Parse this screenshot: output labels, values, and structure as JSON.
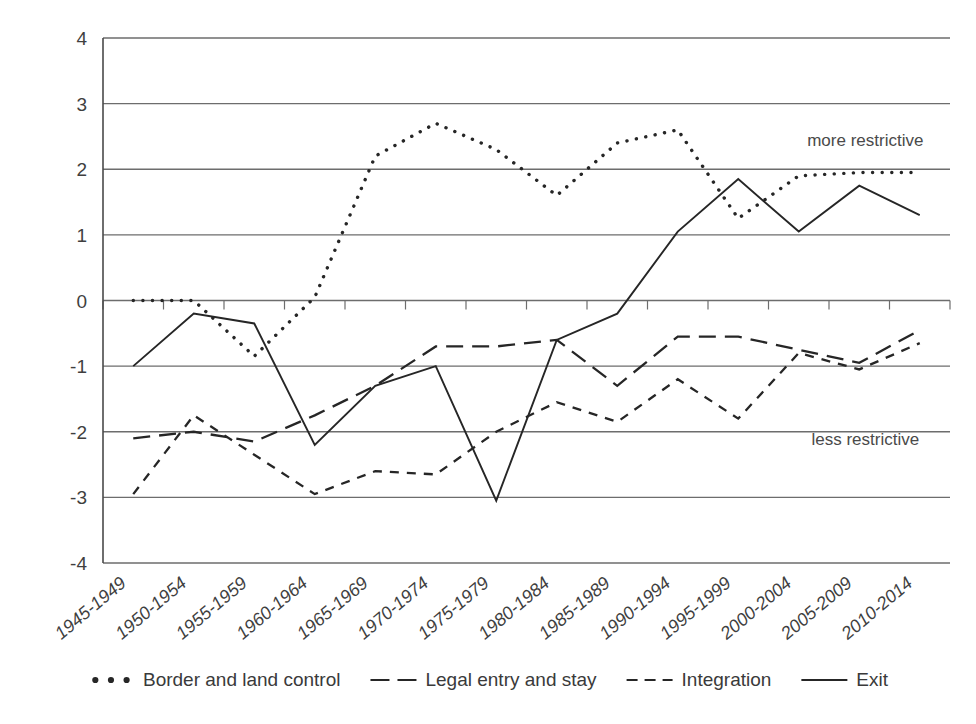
{
  "chart_data": {
    "type": "line",
    "title": "",
    "subtitle": "",
    "xlabel": "",
    "ylabel": "",
    "ylim": [
      -4,
      4
    ],
    "ytick_values": [
      4,
      3,
      2,
      1,
      0,
      -1,
      -2,
      -3,
      -4
    ],
    "ytick_labels": [
      "4",
      "3",
      "2",
      "1",
      "0",
      "-1",
      "-2",
      "-3",
      "-4"
    ],
    "grid": true,
    "grid_axis": "y",
    "legend_position": "bottom",
    "categories": [
      "1945-1949",
      "1950-1954",
      "1955-1959",
      "1960-1964",
      "1965-1969",
      "1970-1974",
      "1975-1979",
      "1980-1984",
      "1985-1989",
      "1990-1994",
      "1995-1999",
      "2000-2004",
      "2005-2009",
      "2010-2014"
    ],
    "series": [
      {
        "name": "Border and land control",
        "style": "dotted",
        "color": "#262626",
        "values": [
          0.0,
          0.0,
          -0.85,
          0.05,
          2.2,
          2.7,
          2.3,
          1.6,
          2.4,
          2.6,
          1.25,
          1.9,
          1.95,
          1.95
        ]
      },
      {
        "name": "Legal entry and stay",
        "style": "long-dash",
        "color": "#262626",
        "values": [
          -2.1,
          -2.0,
          -2.15,
          -1.75,
          -1.3,
          -0.7,
          -0.7,
          -0.6,
          -1.3,
          -0.55,
          -0.55,
          -0.75,
          -0.95,
          -0.45
        ]
      },
      {
        "name": "Integration",
        "style": "short-dash",
        "color": "#262626",
        "values": [
          -2.95,
          -1.75,
          -2.35,
          -2.95,
          -2.6,
          -2.65,
          -2.0,
          -1.55,
          -1.85,
          -1.2,
          -1.8,
          -0.8,
          -1.05,
          -0.65
        ]
      },
      {
        "name": "Exit",
        "style": "solid",
        "color": "#262626",
        "values": [
          -1.0,
          -0.2,
          -0.35,
          -2.2,
          -1.3,
          -1.0,
          -3.05,
          -0.6,
          -0.2,
          1.05,
          1.85,
          1.05,
          1.75,
          1.3
        ]
      }
    ],
    "annotations": [
      {
        "text": "more restrictive",
        "x_value": 12.1,
        "y_value": 2.35
      },
      {
        "text": "less restrictive",
        "x_value": 12.1,
        "y_value": -2.2
      }
    ]
  },
  "legend": {
    "items": [
      {
        "label": "Border and land control",
        "marker": "dotted-marker"
      },
      {
        "label": "Legal entry and stay",
        "marker": "long-dash-marker"
      },
      {
        "label": "Integration",
        "marker": "short-dash-marker"
      },
      {
        "label": "Exit",
        "marker": "solid-line-marker"
      }
    ]
  }
}
